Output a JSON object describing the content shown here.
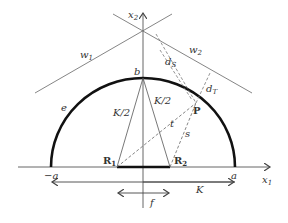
{
  "diagram": {
    "axes": {
      "x1_label": "x",
      "x1_sub": "1",
      "x2_label": "x",
      "x2_sub": "2"
    },
    "ellipse": {
      "label": "e",
      "left_label": "−a",
      "right_label": "a",
      "top_label": "b"
    },
    "points": {
      "R1_label": "R",
      "R1_sub": "1",
      "R2_label": "R",
      "R2_sub": "2",
      "P_label": "P"
    },
    "segments": {
      "left_half_label": "K/2",
      "right_half_label": "K/2",
      "t_label": "t",
      "s_label": "s",
      "dS_label": "d",
      "dS_sub": "S",
      "dT_label": "d",
      "dT_sub": "T"
    },
    "lines": {
      "w1_label": "w",
      "w1_sub": "1",
      "w2_label": "w",
      "w2_sub": "2"
    },
    "dimensions": {
      "K_label": "K",
      "f_label": "f"
    },
    "colors": {
      "stroke": "#555555",
      "thick": "#111111",
      "text": "#333333"
    }
  }
}
